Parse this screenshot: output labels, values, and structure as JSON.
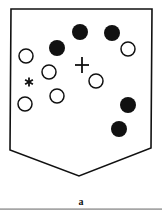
{
  "figure": {
    "label": "a",
    "shape": "shield",
    "stroke_color": "#111111",
    "markers": {
      "filled_circles": [
        {
          "x": 80,
          "y": 32
        },
        {
          "x": 112,
          "y": 33
        },
        {
          "x": 57,
          "y": 48
        },
        {
          "x": 128,
          "y": 105
        },
        {
          "x": 119,
          "y": 129
        }
      ],
      "open_circles": [
        {
          "x": 26,
          "y": 56
        },
        {
          "x": 128,
          "y": 49
        },
        {
          "x": 49,
          "y": 72
        },
        {
          "x": 96,
          "y": 81
        },
        {
          "x": 57,
          "y": 96
        },
        {
          "x": 25,
          "y": 104
        }
      ],
      "plus": {
        "x": 82,
        "y": 65,
        "glyph": "+"
      },
      "asterisk": {
        "x": 29,
        "y": 82,
        "glyph": "*"
      }
    }
  }
}
